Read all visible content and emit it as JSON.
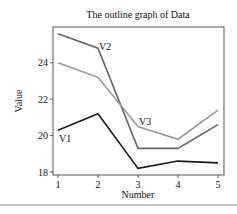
{
  "chart_data": {
    "type": "line",
    "title": "The outline graph of Data",
    "xlabel": "Number",
    "ylabel": "Value",
    "x": [
      1,
      2,
      3,
      4,
      5
    ],
    "xticks": [
      "1",
      "2",
      "3",
      "4",
      "5"
    ],
    "yticks": [
      "18",
      "20",
      "22",
      "24"
    ],
    "ylim": [
      17.8,
      26.0
    ],
    "xlim": [
      0.88,
      5.15
    ],
    "grid": false,
    "legend": "none (inline labels)",
    "series": [
      {
        "name": "V1",
        "color": "#1a1a1a",
        "values": [
          20.3,
          21.2,
          18.2,
          18.6,
          18.5
        ],
        "label_pos": "start"
      },
      {
        "name": "V2",
        "color": "#666666",
        "values": [
          25.6,
          24.8,
          19.3,
          19.3,
          20.6
        ],
        "label_pos": "x2"
      },
      {
        "name": "V3",
        "color": "#999999",
        "values": [
          24.0,
          23.2,
          20.5,
          19.8,
          21.4
        ],
        "label_pos": "x3"
      }
    ]
  }
}
